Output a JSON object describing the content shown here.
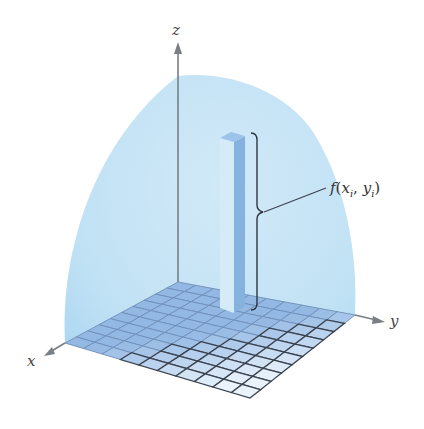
{
  "figure": {
    "axes": {
      "x_label": "x",
      "y_label": "y",
      "z_label": "z"
    },
    "annotation": {
      "function_name": "f",
      "open_paren": "(",
      "arg1": "x",
      "arg1_sub": "i",
      "separator": ", ",
      "arg2": "y",
      "arg2_sub": "i",
      "close_paren": ")"
    },
    "grid": {
      "rows": 10,
      "cols": 10
    },
    "colors": {
      "surface": "#bfe1f5",
      "surface_edge": "#a9d3f0",
      "grid_cell": "#93b8e3",
      "grid_cell_light": "#eaf3fc",
      "grid_line": "#3b4350",
      "column_left": "#d5ebf8",
      "column_right": "#86b2e0",
      "column_top": "#9cc3ea",
      "axis": "#7a7f86",
      "bracket": "#2f3540"
    }
  }
}
